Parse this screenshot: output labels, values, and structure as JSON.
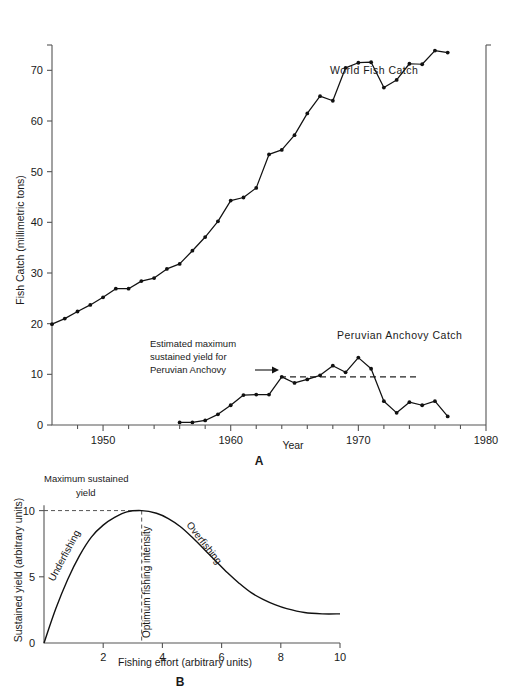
{
  "figure": {
    "panel_a_label": "A",
    "panel_b_label": "B"
  },
  "chart_data": [
    {
      "id": "panel-a",
      "type": "line",
      "title": "",
      "xlabel": "Year",
      "ylabel": "Fish Catch (millimetric tons)",
      "xlim": [
        1946,
        1980
      ],
      "ylim": [
        0,
        75
      ],
      "xticks": [
        1950,
        1960,
        1970,
        1980
      ],
      "xtick_labels": [
        "1950",
        "1960",
        "1970",
        "1980"
      ],
      "xminor_step": 2,
      "yticks": [
        0,
        10,
        20,
        30,
        40,
        50,
        60,
        70
      ],
      "ytick_labels": [
        "0",
        "10",
        "20",
        "30",
        "40",
        "50",
        "60",
        "70"
      ],
      "grid": false,
      "legend_position": "inline-annotation",
      "annotations": [
        {
          "name": "world-fish-catch-label",
          "text": "World Fish Catch",
          "x": 1966.5,
          "y": 63.5
        },
        {
          "name": "peruvian-anchovy-catch-label",
          "text": "Peruvian Anchovy Catch",
          "x": 1967.0,
          "y": 15.8
        },
        {
          "name": "msy-annotation",
          "lines": [
            "Estimated maximum",
            "sustained yield for",
            "Peruvian Anchovy"
          ],
          "arrow": true,
          "reference_value": 9.5,
          "reference_label": "Estimated maximum sustained yield for Peruvian Anchovy"
        }
      ],
      "series": [
        {
          "name": "World Fish Catch",
          "color": "#111111",
          "x": [
            1946,
            1947,
            1948,
            1949,
            1950,
            1951,
            1952,
            1953,
            1954,
            1955,
            1956,
            1957,
            1958,
            1959,
            1960,
            1961,
            1962,
            1963,
            1964,
            1965,
            1966,
            1967,
            1968,
            1969,
            1970,
            1971,
            1972,
            1973,
            1974,
            1975,
            1976,
            1977
          ],
          "values": [
            19.9,
            21.0,
            22.4,
            23.7,
            25.2,
            26.9,
            26.9,
            28.4,
            29.0,
            30.8,
            31.8,
            34.4,
            37.1,
            40.2,
            44.3,
            44.9,
            46.8,
            53.4,
            54.3,
            57.2,
            61.5,
            64.9,
            64.0,
            70.5,
            71.5,
            71.6,
            66.6,
            68.1,
            71.3,
            71.2,
            73.9,
            73.5
          ]
        },
        {
          "name": "Peruvian Anchovy Catch",
          "color": "#111111",
          "x": [
            1956,
            1957,
            1958,
            1959,
            1960,
            1961,
            1962,
            1963,
            1964,
            1965,
            1966,
            1967,
            1968,
            1969,
            1970,
            1971,
            1972,
            1973,
            1974,
            1975,
            1976,
            1977
          ],
          "values": [
            0.5,
            0.5,
            0.9,
            2.1,
            3.9,
            5.9,
            6.0,
            6.0,
            9.5,
            8.3,
            9.0,
            9.8,
            11.7,
            10.4,
            13.3,
            11.1,
            4.7,
            2.4,
            4.5,
            3.9,
            4.7,
            1.7
          ]
        }
      ]
    },
    {
      "id": "panel-b",
      "type": "line",
      "title": "",
      "xlabel": "Fishing effort (arbitrary units)",
      "ylabel": "Sustained yield (arbitrary units)",
      "xlim": [
        0,
        10
      ],
      "ylim": [
        0,
        10.8
      ],
      "xticks": [
        2,
        4,
        6,
        8,
        10
      ],
      "xtick_labels": [
        "2",
        "4",
        "6",
        "8",
        "10"
      ],
      "yticks": [
        0,
        5,
        10
      ],
      "ytick_labels": [
        "0",
        "5",
        "10"
      ],
      "grid": false,
      "maximum_sustained_yield": 10,
      "optimum_fishing_effort": 3.3,
      "annotations": [
        {
          "name": "maximum-sustained-yield-label",
          "lines": [
            "Maximum sustained",
            "yield"
          ]
        },
        {
          "name": "underfishing-label",
          "text": "Underfishing",
          "rotation": -62
        },
        {
          "name": "optimum-fishing-intensity-label",
          "text": "Optimum fishing intensity",
          "rotation": -90
        },
        {
          "name": "overfishing-label",
          "text": "Overfishing",
          "rotation": 52
        }
      ],
      "series": [
        {
          "name": "Sustained yield curve",
          "color": "#111111",
          "x": [
            0,
            0.4,
            0.8,
            1.2,
            1.6,
            2.0,
            2.4,
            2.8,
            3.3,
            3.8,
            4.2,
            4.6,
            5.0,
            5.4,
            5.8,
            6.2,
            6.6,
            7.0,
            7.4,
            7.8,
            8.2,
            8.8,
            9.4,
            10.0
          ],
          "values": [
            0.0,
            2.6,
            4.8,
            6.6,
            8.0,
            8.9,
            9.5,
            9.9,
            10.0,
            9.8,
            9.4,
            8.8,
            8.0,
            7.1,
            6.2,
            5.3,
            4.5,
            3.8,
            3.3,
            2.9,
            2.6,
            2.3,
            2.2,
            2.2
          ]
        }
      ]
    }
  ]
}
